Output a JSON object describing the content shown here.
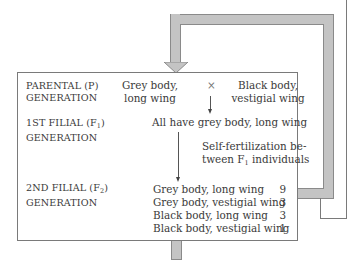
{
  "diagram": {
    "colors": {
      "feedback_arrow_fill": "#c4c4c4",
      "feedback_arrow_border": "#8a8a8a",
      "box_border": "#7a7a7a",
      "text": "#3a3a3a"
    },
    "generations": [
      {
        "label_line1": "PARENTAL (P)",
        "label_line2": "GENERATION"
      },
      {
        "label_line1": "1ST FILIAL (F",
        "label_sub": "1",
        "label_line1_end": ")",
        "label_line2": "GENERATION"
      },
      {
        "label_line1": "2ND FILIAL (F",
        "label_sub": "2",
        "label_line1_end": ")",
        "label_line2": "GENERATION"
      }
    ],
    "parents": {
      "left_line1": "Grey body,",
      "left_line2": "long wing",
      "cross_symbol": "×",
      "right_line1": "Black body,",
      "right_line2": "vestigial wing"
    },
    "f1_result": "All have grey body, long wing",
    "self_fert": {
      "line1": "Self-fertilization be-",
      "line2_start": "tween F",
      "line2_sub": "1",
      "line2_end": " individuals"
    },
    "f2_results": [
      {
        "phenotype": "Grey body, long wing",
        "ratio": "9"
      },
      {
        "phenotype": "Grey body, vestigial wing",
        "ratio": "3"
      },
      {
        "phenotype": "Black body, long wing",
        "ratio": "3"
      },
      {
        "phenotype": "Black body, vestigial wing",
        "ratio": "1"
      }
    ]
  }
}
